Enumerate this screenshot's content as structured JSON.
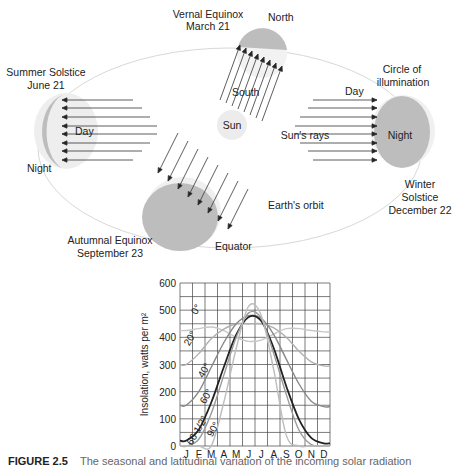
{
  "diagram": {
    "labels": {
      "vernal": [
        "Vernal Equinox",
        "March 21"
      ],
      "north": "North",
      "south": "South",
      "summer": [
        "Summer Solstice",
        "June 21"
      ],
      "day_left": "Day",
      "night_left": "Night",
      "sun": "Sun",
      "day_right": "Day",
      "circle": [
        "Circle of",
        "illumination"
      ],
      "sun_rays": "Sun's rays",
      "night_right": "Night",
      "winter": [
        "Winter",
        "Solstice",
        "December 22"
      ],
      "orbit": "Earth's orbit",
      "autumnal": [
        "Autumnal Equinox",
        "September 23"
      ],
      "equator": "Equator"
    }
  },
  "caption": {
    "figure": "FIGURE 2.5",
    "text": "The seasonal and latitudinal variation of the incoming solar radiation"
  },
  "chart_data": {
    "type": "line",
    "title": "",
    "xlabel": "",
    "ylabel": "Insolation, watts per m²",
    "categories": [
      "J",
      "F",
      "M",
      "A",
      "M",
      "J",
      "J",
      "A",
      "S",
      "O",
      "N",
      "D"
    ],
    "ylim": [
      0,
      600
    ],
    "yticks": [
      0,
      100,
      200,
      300,
      400,
      500,
      600
    ],
    "grid": true,
    "series": [
      {
        "name": "0°",
        "color": "#c8c8c8",
        "values": [
          425,
          432,
          438,
          425,
          400,
          385,
          390,
          412,
          432,
          432,
          425,
          420
        ]
      },
      {
        "name": "20°",
        "color": "#b0b0b0",
        "values": [
          300,
          340,
          395,
          430,
          450,
          450,
          450,
          435,
          400,
          350,
          310,
          295
        ]
      },
      {
        "name": "40°",
        "color": "#888888",
        "values": [
          150,
          200,
          290,
          380,
          450,
          480,
          470,
          410,
          320,
          230,
          165,
          145
        ]
      },
      {
        "name": "60°",
        "color": "#222222",
        "values": [
          20,
          60,
          160,
          290,
          410,
          475,
          460,
          360,
          220,
          100,
          30,
          10
        ]
      },
      {
        "name": "66 1/2°",
        "color": "#9a9a9a",
        "values": [
          0,
          25,
          120,
          260,
          400,
          490,
          470,
          340,
          190,
          60,
          5,
          0
        ]
      },
      {
        "name": "90°",
        "color": "#bdbdbd",
        "values": [
          0,
          0,
          0,
          160,
          360,
          515,
          480,
          280,
          40,
          0,
          0,
          0
        ]
      }
    ]
  }
}
